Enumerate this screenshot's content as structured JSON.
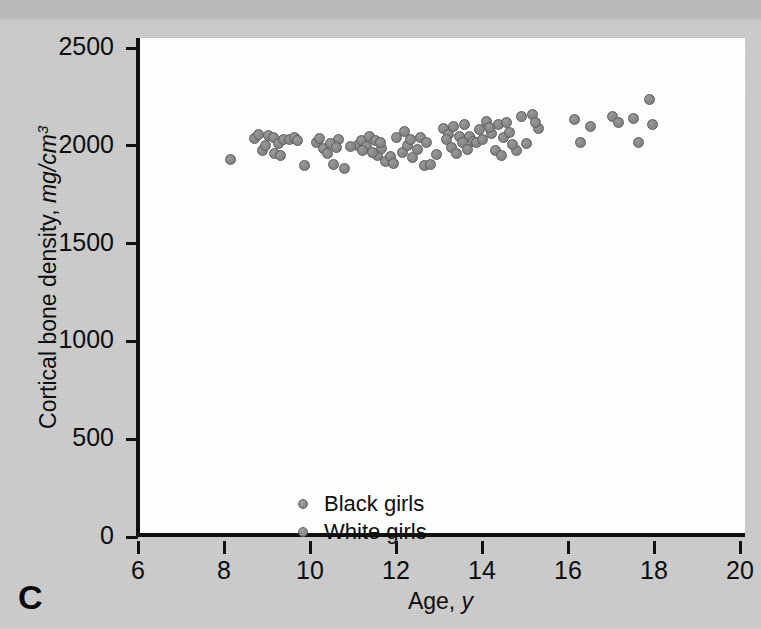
{
  "panel": {
    "letter": "C"
  },
  "axes": {
    "x": {
      "title_text": "Age, ",
      "title_unit": "y",
      "ticks": [
        6,
        8,
        10,
        12,
        14,
        16,
        18,
        20
      ],
      "min": 6,
      "max": 20,
      "label": "Age, y"
    },
    "y": {
      "title_text": "Cortical bone density, ",
      "title_unit": "mg/cm",
      "title_exponent": "3",
      "ticks": [
        0,
        500,
        1000,
        1500,
        2000,
        2500
      ],
      "min": 0,
      "max": 2500,
      "label": "Cortical bone density, mg/cm3"
    }
  },
  "legend": {
    "items": [
      {
        "label": "Black girls",
        "color": "#8a8a8a"
      },
      {
        "label": "White girls",
        "color": "#8a8a8a"
      }
    ]
  },
  "colors": {
    "background": "#c9c9c9",
    "plot_background": "#fdfdfd",
    "axis": "#111111",
    "marker_fill": "#8a8a8a",
    "marker_stroke": "#5c5c5c",
    "text": "#0d0d0d"
  },
  "chart_data": {
    "type": "scatter",
    "title": "C",
    "xlabel": "Age, y",
    "ylabel": "Cortical bone density, mg/cm3",
    "xlim": [
      6,
      20
    ],
    "ylim": [
      0,
      2500
    ],
    "grid": false,
    "legend_position": "lower-left",
    "marker_size_px": 11,
    "series": [
      {
        "name": "Black girls",
        "marker": "circle",
        "color": "#8a8a8a",
        "points": [
          [
            8.05,
            1930
          ],
          [
            8.62,
            2035
          ],
          [
            8.72,
            2060
          ],
          [
            8.8,
            1975
          ],
          [
            8.95,
            2055
          ],
          [
            9.05,
            2045
          ],
          [
            9.18,
            2012
          ],
          [
            9.3,
            2032
          ],
          [
            9.42,
            2030
          ],
          [
            9.55,
            2040
          ],
          [
            9.62,
            2028
          ],
          [
            9.78,
            1900
          ],
          [
            10.05,
            2018
          ],
          [
            10.22,
            1985
          ],
          [
            10.32,
            1960
          ],
          [
            10.45,
            1905
          ],
          [
            10.58,
            2030
          ],
          [
            10.7,
            1885
          ],
          [
            11.02,
            2002
          ],
          [
            11.1,
            2028
          ],
          [
            11.22,
            1998
          ],
          [
            11.3,
            2050
          ],
          [
            11.42,
            2028
          ],
          [
            11.48,
            1948
          ],
          [
            11.58,
            1988
          ],
          [
            11.66,
            1922
          ],
          [
            11.78,
            1945
          ],
          [
            11.92,
            2045
          ],
          [
            12.05,
            1968
          ],
          [
            12.18,
            2002
          ],
          [
            12.3,
            1940
          ],
          [
            12.48,
            2040
          ],
          [
            12.58,
            1898
          ],
          [
            12.7,
            1902
          ],
          [
            13.02,
            2088
          ],
          [
            13.12,
            2060
          ],
          [
            13.25,
            2098
          ],
          [
            13.38,
            2050
          ],
          [
            13.5,
            2108
          ],
          [
            13.62,
            2048
          ],
          [
            13.72,
            2020
          ],
          [
            13.85,
            2085
          ],
          [
            14.02,
            2122
          ],
          [
            14.12,
            2062
          ],
          [
            14.28,
            2108
          ],
          [
            14.4,
            2045
          ],
          [
            14.55,
            2068
          ],
          [
            14.7,
            1978
          ],
          [
            15.08,
            2162
          ],
          [
            15.22,
            2090
          ],
          [
            16.05,
            2132
          ],
          [
            16.2,
            2018
          ],
          [
            16.95,
            2152
          ],
          [
            17.42,
            2140
          ],
          [
            17.55,
            2018
          ],
          [
            17.8,
            2238
          ],
          [
            17.88,
            2108
          ]
        ]
      },
      {
        "name": "White girls",
        "marker": "circle",
        "color": "#8a8a8a",
        "points": [
          [
            8.88,
            2000
          ],
          [
            9.08,
            1962
          ],
          [
            9.22,
            1948
          ],
          [
            10.12,
            2038
          ],
          [
            10.38,
            2010
          ],
          [
            10.52,
            1990
          ],
          [
            10.85,
            1995
          ],
          [
            11.12,
            1975
          ],
          [
            11.35,
            1968
          ],
          [
            11.55,
            2018
          ],
          [
            11.85,
            1910
          ],
          [
            12.1,
            2075
          ],
          [
            12.25,
            2032
          ],
          [
            12.4,
            1982
          ],
          [
            12.62,
            2018
          ],
          [
            12.85,
            1955
          ],
          [
            13.08,
            2032
          ],
          [
            13.2,
            1990
          ],
          [
            13.32,
            1962
          ],
          [
            13.45,
            2018
          ],
          [
            13.58,
            1982
          ],
          [
            13.78,
            2015
          ],
          [
            13.92,
            2032
          ],
          [
            14.08,
            2095
          ],
          [
            14.22,
            1975
          ],
          [
            14.35,
            1948
          ],
          [
            14.48,
            2120
          ],
          [
            14.62,
            2005
          ],
          [
            14.82,
            2148
          ],
          [
            14.95,
            2010
          ],
          [
            15.15,
            2118
          ],
          [
            16.42,
            2098
          ],
          [
            17.08,
            2118
          ]
        ]
      }
    ]
  }
}
